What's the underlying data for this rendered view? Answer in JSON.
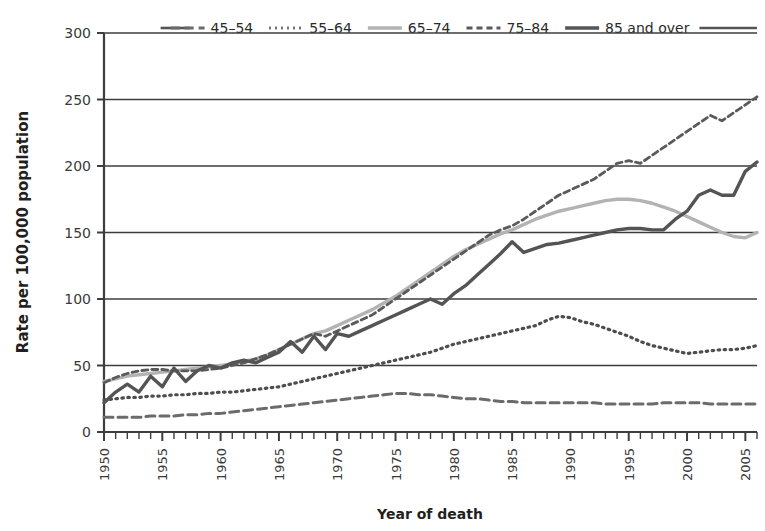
{
  "chart_data": {
    "type": "line",
    "title": "",
    "subtitle": "",
    "xlabel": "Year of death",
    "ylabel": "Rate per 100,000 population",
    "xlim": [
      1950,
      2006
    ],
    "ylim": [
      0,
      300
    ],
    "yticks": [
      0,
      50,
      100,
      150,
      200,
      250,
      300
    ],
    "xticks_labeled": [
      1950,
      1955,
      1960,
      1965,
      1970,
      1975,
      1980,
      1985,
      1990,
      1995,
      2000,
      2005
    ],
    "xtick_step_minor": 1,
    "grid": "horizontal",
    "legend_position": "top",
    "x": [
      1950,
      1951,
      1952,
      1953,
      1954,
      1955,
      1956,
      1957,
      1958,
      1959,
      1960,
      1961,
      1962,
      1963,
      1964,
      1965,
      1966,
      1967,
      1968,
      1969,
      1970,
      1971,
      1972,
      1973,
      1974,
      1975,
      1976,
      1977,
      1978,
      1979,
      1980,
      1981,
      1982,
      1983,
      1984,
      1985,
      1986,
      1987,
      1988,
      1989,
      1990,
      1991,
      1992,
      1993,
      1994,
      1995,
      1996,
      1997,
      1998,
      1999,
      2000,
      2001,
      2002,
      2003,
      2004,
      2005,
      2006
    ],
    "series": [
      {
        "name": "45-54",
        "label": "45–54",
        "style": "dashed",
        "color": "#6b6b6b",
        "dash": "9,5",
        "width": 3,
        "values": [
          11,
          11,
          11,
          11,
          12,
          12,
          12,
          13,
          13,
          14,
          14,
          15,
          16,
          17,
          18,
          19,
          20,
          21,
          22,
          23,
          24,
          25,
          26,
          27,
          28,
          29,
          29,
          28,
          28,
          27,
          26,
          25,
          25,
          24,
          23,
          23,
          22,
          22,
          22,
          22,
          22,
          22,
          22,
          21,
          21,
          21,
          21,
          21,
          22,
          22,
          22,
          22,
          21,
          21,
          21,
          21,
          21
        ]
      },
      {
        "name": "55-64",
        "label": "55–64",
        "style": "dotted",
        "color": "#4d4d4d",
        "dash": "1.5,4.5",
        "width": 3.2,
        "values": [
          24,
          25,
          26,
          26,
          27,
          27,
          28,
          28,
          29,
          29,
          30,
          30,
          31,
          32,
          33,
          34,
          36,
          38,
          40,
          42,
          44,
          46,
          48,
          50,
          52,
          54,
          56,
          58,
          60,
          63,
          66,
          68,
          70,
          72,
          74,
          76,
          78,
          80,
          84,
          87,
          86,
          83,
          81,
          78,
          75,
          72,
          68,
          65,
          63,
          61,
          59,
          60,
          61,
          62,
          62,
          63,
          65
        ]
      },
      {
        "name": "65-74",
        "label": "65–74",
        "style": "solid-light",
        "color": "#b3b3b3",
        "dash": "",
        "width": 3.4,
        "values": [
          38,
          40,
          42,
          43,
          44,
          45,
          46,
          47,
          48,
          49,
          50,
          51,
          53,
          55,
          58,
          62,
          66,
          70,
          74,
          76,
          80,
          84,
          88,
          92,
          97,
          102,
          108,
          114,
          120,
          126,
          132,
          137,
          141,
          145,
          149,
          152,
          156,
          160,
          163,
          166,
          168,
          170,
          172,
          174,
          175,
          175,
          174,
          172,
          169,
          166,
          162,
          158,
          154,
          150,
          147,
          146,
          150
        ]
      },
      {
        "name": "75-84",
        "label": "75–84",
        "style": "dashed-fine",
        "color": "#5a5a5a",
        "dash": "6,4",
        "width": 2.8,
        "values": [
          37,
          41,
          44,
          46,
          47,
          47,
          46,
          46,
          46,
          47,
          48,
          50,
          52,
          55,
          58,
          62,
          66,
          70,
          74,
          72,
          76,
          80,
          84,
          88,
          94,
          100,
          106,
          112,
          118,
          124,
          130,
          136,
          142,
          148,
          152,
          155,
          160,
          166,
          172,
          178,
          182,
          186,
          190,
          196,
          202,
          204,
          202,
          208,
          214,
          220,
          226,
          232,
          238,
          234,
          240,
          246,
          252
        ]
      },
      {
        "name": "85 and over",
        "label": "85 and over",
        "style": "solid-dark",
        "color": "#545454",
        "dash": "",
        "width": 3.4,
        "values": [
          22,
          30,
          36,
          30,
          42,
          34,
          48,
          38,
          46,
          50,
          48,
          52,
          54,
          52,
          56,
          60,
          68,
          60,
          72,
          62,
          74,
          72,
          76,
          80,
          84,
          88,
          92,
          96,
          100,
          96,
          104,
          110,
          118,
          126,
          134,
          143,
          135,
          138,
          141,
          142,
          144,
          146,
          148,
          150,
          152,
          153,
          153,
          152,
          152,
          160,
          166,
          178,
          182,
          178,
          178,
          196,
          203
        ]
      }
    ],
    "annotations": []
  },
  "legend": {
    "items": [
      {
        "label": "45–54"
      },
      {
        "label": "55–64"
      },
      {
        "label": "65–74"
      },
      {
        "label": "75–84"
      },
      {
        "label": "85 and over"
      }
    ]
  },
  "axes": {
    "y_title": "Rate per 100,000 population",
    "x_title": "Year of death"
  }
}
